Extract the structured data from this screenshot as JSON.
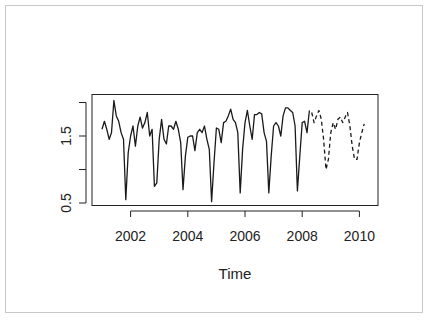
{
  "chart_data": {
    "type": "line",
    "title": "",
    "xlabel": "Time",
    "ylabel": "",
    "xlim": [
      2000.6,
      2010.6
    ],
    "ylim": [
      0.5,
      2.1
    ],
    "x_ticks": [
      2002,
      2004,
      2006,
      2008,
      2010
    ],
    "x_tick_labels": [
      "2002",
      "2004",
      "2006",
      "2008",
      "2010"
    ],
    "y_ticks": [
      0.5,
      1.0,
      1.5,
      2.0
    ],
    "y_tick_labels": [
      "0.5",
      "",
      "1.5",
      ""
    ],
    "grid": false,
    "legend": null,
    "series": [
      {
        "name": "observed",
        "style": "solid",
        "start": 2001.0,
        "frequency": 12,
        "values": [
          1.6,
          1.72,
          1.6,
          1.45,
          1.55,
          2.03,
          1.8,
          1.72,
          1.55,
          1.45,
          0.55,
          1.25,
          1.5,
          1.65,
          1.35,
          1.65,
          1.78,
          1.62,
          1.7,
          1.85,
          1.5,
          1.6,
          0.75,
          0.8,
          1.45,
          1.75,
          1.45,
          1.38,
          1.65,
          1.65,
          1.6,
          1.72,
          1.6,
          1.4,
          0.7,
          1.2,
          1.48,
          1.5,
          1.5,
          1.28,
          1.55,
          1.6,
          1.55,
          1.65,
          1.45,
          1.3,
          0.52,
          1.1,
          1.62,
          1.6,
          1.4,
          1.7,
          1.72,
          1.8,
          1.9,
          1.75,
          1.7,
          1.55,
          0.65,
          1.3,
          1.7,
          1.88,
          1.65,
          1.45,
          1.82,
          1.82,
          1.85,
          1.83,
          1.55,
          1.42,
          0.65,
          1.2,
          1.65,
          1.7,
          1.65,
          1.5,
          1.8,
          1.92,
          1.92,
          1.88,
          1.85,
          1.65,
          0.68,
          1.2,
          1.7,
          1.72,
          1.55,
          1.88
        ]
      },
      {
        "name": "forecast",
        "style": "dashed",
        "start": 2008.3333,
        "frequency": 12,
        "values": [
          1.85,
          1.7,
          1.8,
          1.88,
          1.75,
          1.45,
          1.0,
          1.15,
          1.55,
          1.7,
          1.6,
          1.75,
          1.78,
          1.7,
          1.78,
          1.85,
          1.65,
          1.35,
          1.15,
          1.15,
          1.4,
          1.55,
          1.68
        ]
      }
    ]
  }
}
